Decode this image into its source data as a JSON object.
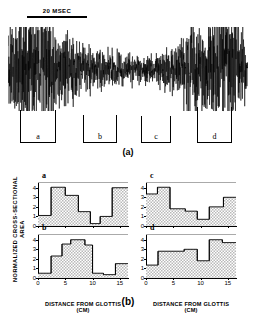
{
  "figure": {
    "panel_a": {
      "caption": "(a)",
      "scalebar_label": "20 MSEC",
      "segments": [
        {
          "id": "seg-a",
          "label": "a"
        },
        {
          "id": "seg-b",
          "label": "b"
        },
        {
          "id": "seg-c",
          "label": "c"
        },
        {
          "id": "seg-d",
          "label": "d"
        }
      ]
    },
    "panel_b": {
      "caption": "(b)",
      "ylabel": "NORMALIZED  CROSS-SECTIONAL  AREA",
      "xlabel_left": "DISTANCE  FROM  GLOTTIS  (CM)",
      "xlabel_right": "DISTANCE  FROM  GLOTTIS  (CM)"
    }
  },
  "chart_data": [
    {
      "type": "area",
      "title": "a",
      "panel": "top-left",
      "xlabel": "DISTANCE  FROM  GLOTTIS  (CM)",
      "ylabel": "NORMALIZED  CROSS-SECTIONAL  AREA",
      "xlim": [
        0,
        16.5
      ],
      "ylim": [
        0,
        4.6
      ],
      "xticks": [
        0,
        5,
        10,
        15
      ],
      "xticklabels": [
        "0",
        "5",
        "10",
        "15"
      ],
      "yticks": [
        0,
        1,
        2,
        3,
        4
      ],
      "yticklabels": [
        "0",
        "1",
        "2",
        "3",
        "4"
      ],
      "grid": false,
      "step_edges": [
        0,
        2.4,
        5.0,
        7.4,
        9.6,
        11.4,
        13.6,
        16.5
      ],
      "values": [
        1.1,
        4.05,
        3.2,
        1.5,
        0.25,
        1.0,
        4.0
      ]
    },
    {
      "type": "area",
      "title": "b",
      "panel": "bottom-left",
      "xlabel": "DISTANCE  FROM  GLOTTIS  (CM)",
      "ylabel": "NORMALIZED  CROSS-SECTIONAL  AREA",
      "xlim": [
        0,
        16.5
      ],
      "ylim": [
        0,
        4.6
      ],
      "xticks": [
        0,
        5,
        10,
        15
      ],
      "xticklabels": [
        "0",
        "5",
        "10",
        "15"
      ],
      "yticks": [
        0,
        1,
        2,
        3,
        4
      ],
      "yticklabels": [
        "0",
        "1",
        "2",
        "3",
        "4"
      ],
      "grid": false,
      "step_edges": [
        0,
        2.4,
        4.4,
        6.0,
        8.6,
        10.0,
        12.0,
        14.2,
        16.5
      ],
      "values": [
        0.5,
        2.3,
        3.55,
        4.0,
        3.45,
        0.5,
        0.35,
        1.5
      ]
    },
    {
      "type": "area",
      "title": "c",
      "panel": "top-right",
      "xlabel": "DISTANCE  FROM  GLOTTIS  (CM)",
      "ylabel": "NORMALIZED  CROSS-SECTIONAL  AREA",
      "xlim": [
        0,
        16.5
      ],
      "ylim": [
        0,
        4.6
      ],
      "xticks": [
        0,
        5,
        10,
        15
      ],
      "xticklabels": [
        "0",
        "5",
        "10",
        "15"
      ],
      "yticks": [
        0,
        1,
        2,
        3,
        4
      ],
      "yticklabels": [
        "0",
        "1",
        "2",
        "3",
        "4"
      ],
      "grid": false,
      "step_edges": [
        0,
        2.1,
        4.4,
        7.2,
        9.4,
        11.6,
        14.2,
        16.5
      ],
      "values": [
        3.35,
        4.05,
        1.8,
        1.55,
        0.7,
        2.0,
        3.0
      ]
    },
    {
      "type": "area",
      "title": "d",
      "panel": "bottom-right",
      "xlabel": "DISTANCE  FROM  GLOTTIS  (CM)",
      "ylabel": "NORMALIZED  CROSS-SECTIONAL  AREA",
      "xlim": [
        0,
        16.5
      ],
      "ylim": [
        0,
        4.6
      ],
      "xticks": [
        0,
        5,
        10,
        15
      ],
      "xticklabels": [
        "0",
        "5",
        "10",
        "15"
      ],
      "yticks": [
        0,
        1,
        2,
        3,
        4
      ],
      "yticklabels": [
        "0",
        "1",
        "2",
        "3",
        "4"
      ],
      "grid": false,
      "step_edges": [
        0,
        2.2,
        7.0,
        9.4,
        11.6,
        14.0,
        16.5
      ],
      "values": [
        1.35,
        2.8,
        3.0,
        1.8,
        4.0,
        3.7
      ]
    }
  ],
  "waveform": {
    "description": "acoustic speech pressure waveform",
    "segments_marked": [
      "a",
      "b",
      "c",
      "d"
    ]
  }
}
